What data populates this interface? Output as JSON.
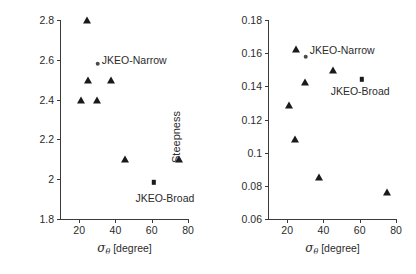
{
  "figure": {
    "panels": [
      {
        "id": "left",
        "chart_data": {
          "type": "scatter",
          "title": "",
          "xlabel": "sigma_theta [degree]",
          "ylabel": "Q_p",
          "xlim": [
            10,
            80
          ],
          "ylim": [
            1.8,
            2.8
          ],
          "xticks": [
            20,
            40,
            60,
            80
          ],
          "xtick_labels": [
            "20",
            "40",
            "60",
            "80"
          ],
          "yticks": [
            1.8,
            2.0,
            2.2,
            2.4,
            2.6,
            2.8
          ],
          "ytick_labels": [
            "1.8",
            "2",
            "2.2",
            "2.4",
            "2.6",
            "2.8"
          ],
          "grid": false,
          "legend": "none",
          "series": [
            {
              "name": "Buoy observations",
              "marker": "triangle",
              "points": [
                {
                  "x": 20.8,
                  "y": 2.4
                },
                {
                  "x": 24.6,
                  "y": 2.8
                },
                {
                  "x": 24.8,
                  "y": 2.5
                },
                {
                  "x": 29.6,
                  "y": 2.4
                },
                {
                  "x": 37.8,
                  "y": 2.5
                },
                {
                  "x": 45.2,
                  "y": 2.1
                },
                {
                  "x": 74.8,
                  "y": 2.1
                }
              ]
            },
            {
              "name": "JKEO-Narrow",
              "marker": "circle",
              "points": [
                {
                  "x": 30.2,
                  "y": 2.58
                }
              ]
            },
            {
              "name": "JKEO-Broad",
              "marker": "square",
              "points": [
                {
                  "x": 61.3,
                  "y": 1.985
                }
              ]
            }
          ],
          "annotations": [
            {
              "text": "JKEO-Narrow",
              "x": 32.5,
              "y": 2.6,
              "align": "left"
            },
            {
              "text": "JKEO-Broad",
              "x": 51.0,
              "y": 1.905,
              "align": "left"
            }
          ]
        }
      },
      {
        "id": "right",
        "chart_data": {
          "type": "scatter",
          "title": "",
          "xlabel": "sigma_theta [degree]",
          "ylabel": "Steepness",
          "xlim": [
            10,
            80
          ],
          "ylim": [
            0.06,
            0.18
          ],
          "xticks": [
            20,
            40,
            60,
            80
          ],
          "xtick_labels": [
            "20",
            "40",
            "60",
            "80"
          ],
          "yticks": [
            0.06,
            0.08,
            0.1,
            0.12,
            0.14,
            0.16,
            0.18
          ],
          "ytick_labels": [
            "0.06",
            "0.08",
            "0.1",
            "0.12",
            "0.14",
            "0.16",
            "0.18"
          ],
          "grid": false,
          "legend": "none",
          "series": [
            {
              "name": "Buoy observations",
              "marker": "triangle",
              "points": [
                {
                  "x": 20.8,
                  "y": 0.1288
                },
                {
                  "x": 24.6,
                  "y": 0.108
                },
                {
                  "x": 24.9,
                  "y": 0.1625
                },
                {
                  "x": 29.8,
                  "y": 0.1428
                },
                {
                  "x": 37.8,
                  "y": 0.0852
                },
                {
                  "x": 45.2,
                  "y": 0.15
                },
                {
                  "x": 74.8,
                  "y": 0.0765
                }
              ]
            },
            {
              "name": "JKEO-Narrow",
              "marker": "circle",
              "points": [
                {
                  "x": 30.2,
                  "y": 0.1578
                }
              ]
            },
            {
              "name": "JKEO-Broad",
              "marker": "square",
              "points": [
                {
                  "x": 61.3,
                  "y": 0.1442
                }
              ]
            }
          ],
          "annotations": [
            {
              "text": "JKEO-Narrow",
              "x": 32.5,
              "y": 0.1618,
              "align": "left"
            },
            {
              "text": "JKEO-Broad",
              "x": 44.0,
              "y": 0.1372,
              "align": "left"
            }
          ]
        }
      }
    ]
  }
}
